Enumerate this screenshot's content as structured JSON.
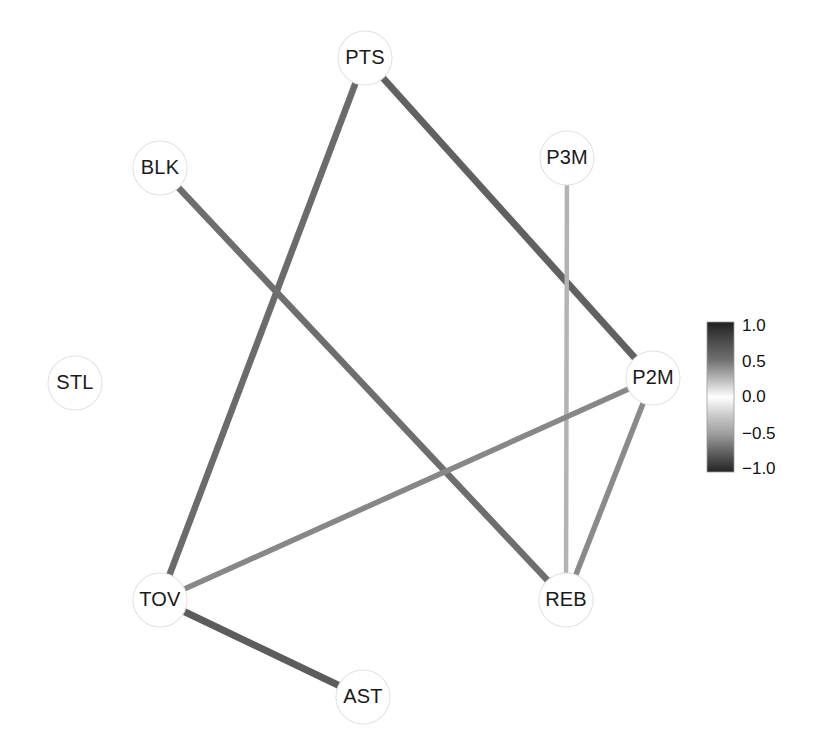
{
  "figure": {
    "title": "",
    "background_color": "#ffffff",
    "width": 823,
    "height": 754
  },
  "graph": {
    "type": "network-graph",
    "node_radius": 27,
    "node_fill": "#ffffff",
    "node_stroke": "#e2e2e2",
    "label_color": "#1a1a1a",
    "nodes": [
      {
        "id": "PTS",
        "label": "PTS",
        "x": 365,
        "y": 58
      },
      {
        "id": "BLK",
        "label": "BLK",
        "x": 160,
        "y": 168
      },
      {
        "id": "P3M",
        "label": "P3M",
        "x": 567,
        "y": 158
      },
      {
        "id": "STL",
        "label": "STL",
        "x": 75,
        "y": 383
      },
      {
        "id": "P2M",
        "label": "P2M",
        "x": 653,
        "y": 378
      },
      {
        "id": "REB",
        "label": "REB",
        "x": 566,
        "y": 600
      },
      {
        "id": "TOV",
        "label": "TOV",
        "x": 160,
        "y": 600
      },
      {
        "id": "AST",
        "label": "AST",
        "x": 363,
        "y": 697
      }
    ],
    "edges": [
      {
        "source": "PTS",
        "target": "TOV",
        "weight": 0.72,
        "color": "#6b6b6b",
        "width": 6.5
      },
      {
        "source": "PTS",
        "target": "P2M",
        "weight": 0.8,
        "color": "#616161",
        "width": 7.0
      },
      {
        "source": "BLK",
        "target": "REB",
        "weight": 0.7,
        "color": "#6e6e6e",
        "width": 6.5
      },
      {
        "source": "P3M",
        "target": "REB",
        "weight": 0.22,
        "color": "#b3b3b3",
        "width": 4.5
      },
      {
        "source": "TOV",
        "target": "P2M",
        "weight": 0.52,
        "color": "#878787",
        "width": 5.5
      },
      {
        "source": "TOV",
        "target": "AST",
        "weight": 0.78,
        "color": "#5c5c5c",
        "width": 7.0
      },
      {
        "source": "REB",
        "target": "P2M",
        "weight": 0.58,
        "color": "#8a8a8a",
        "width": 5.5
      }
    ]
  },
  "colorbar": {
    "name": "correlation-colorbar",
    "orientation": "vertical",
    "x": 707,
    "y": 322,
    "width": 27,
    "height": 150,
    "vmin": -1.0,
    "vmax": 1.0,
    "colormap": "gray-diverging",
    "stops": [
      {
        "value": 1.0,
        "color": "#1f1f1f"
      },
      {
        "value": 0.75,
        "color": "#4a4a4a"
      },
      {
        "value": 0.5,
        "color": "#6f6f6f"
      },
      {
        "value": 0.25,
        "color": "#b5b5b5"
      },
      {
        "value": 0.0,
        "color": "#ffffff"
      },
      {
        "value": -0.25,
        "color": "#c9c9c9"
      },
      {
        "value": -0.5,
        "color": "#9c9c9c"
      },
      {
        "value": -0.75,
        "color": "#5e5e5e"
      },
      {
        "value": -1.0,
        "color": "#242424"
      }
    ],
    "ticks": [
      {
        "label": "1.0",
        "value": 1.0,
        "y": 327
      },
      {
        "label": "0.5",
        "value": 0.5,
        "y": 363
      },
      {
        "label": "0.0",
        "value": 0.0,
        "y": 398
      },
      {
        "label": "−0.5",
        "value": -0.5,
        "y": 435
      },
      {
        "label": "−1.0",
        "value": -1.0,
        "y": 470
      }
    ],
    "tick_label_x": 742
  },
  "chart_data": {
    "type": "network-graph",
    "title": "",
    "xlabel": "",
    "ylabel": "",
    "node_names": [
      "PTS",
      "BLK",
      "P3M",
      "STL",
      "P2M",
      "REB",
      "TOV",
      "AST"
    ],
    "node_positions": [
      [
        365,
        58
      ],
      [
        160,
        168
      ],
      [
        567,
        158
      ],
      [
        75,
        383
      ],
      [
        653,
        378
      ],
      [
        566,
        600
      ],
      [
        160,
        600
      ],
      [
        363,
        697
      ]
    ],
    "edges": [
      [
        "PTS",
        "TOV",
        0.72
      ],
      [
        "PTS",
        "P2M",
        0.8
      ],
      [
        "BLK",
        "REB",
        0.7
      ],
      [
        "P3M",
        "REB",
        0.22
      ],
      [
        "TOV",
        "P2M",
        0.52
      ],
      [
        "TOV",
        "AST",
        0.78
      ],
      [
        "REB",
        "P2M",
        0.58
      ]
    ],
    "isolated_nodes": [
      "STL"
    ],
    "colorbar_range": [
      -1.0,
      1.0
    ],
    "colorbar_ticks": [
      "1.0",
      "0.5",
      "0.0",
      "−0.5",
      "−1.0"
    ],
    "legend_position": "right",
    "grid": false
  }
}
